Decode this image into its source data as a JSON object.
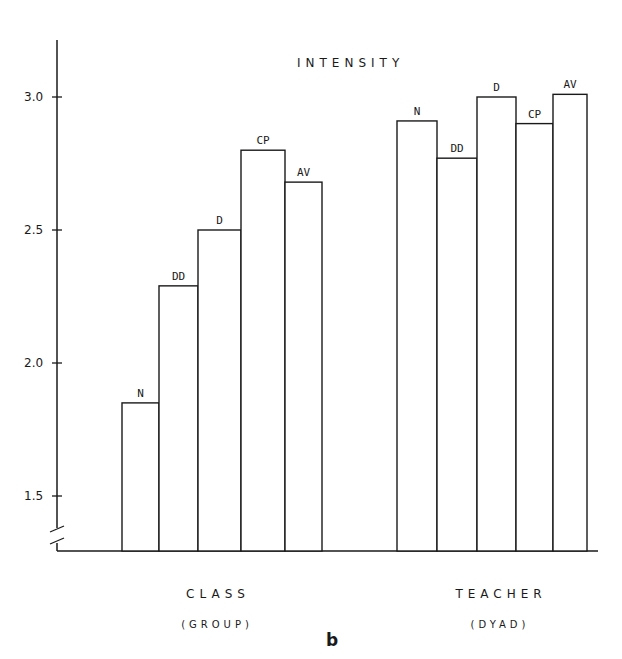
{
  "chart_data": {
    "type": "bar",
    "title": "INTENSITY",
    "panel_label": "b",
    "xlabel": "",
    "ylabel": "",
    "ylim": [
      1.3,
      3.2
    ],
    "yticks": [
      "1.5",
      "2.0",
      "2.5",
      "3.0"
    ],
    "axis_break": true,
    "grid": false,
    "legend": null,
    "groups": [
      {
        "name": "CLASS",
        "sub": "(GROUP)",
        "categories": [
          "N",
          "DD",
          "D",
          "CP",
          "AV"
        ],
        "values": [
          1.85,
          2.29,
          2.5,
          2.8,
          2.68
        ]
      },
      {
        "name": "TEACHER",
        "sub": "(DYAD)",
        "categories": [
          "N",
          "DD",
          "D",
          "CP",
          "AV"
        ],
        "values": [
          2.91,
          2.77,
          3.0,
          2.9,
          3.01
        ]
      }
    ]
  }
}
